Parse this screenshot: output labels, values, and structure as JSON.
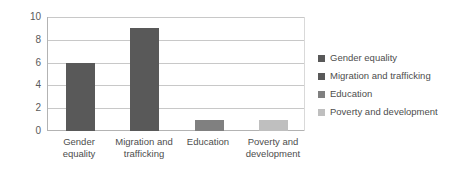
{
  "chart_data": {
    "type": "bar",
    "title": "",
    "subtitle": "",
    "xlabel": "",
    "ylabel": "",
    "categories": [
      "Gender equality",
      "Migration and trafficking",
      "Education",
      "Poverty and development"
    ],
    "values": [
      6,
      9,
      1,
      1
    ],
    "ylim": [
      0,
      10
    ],
    "yticks": [
      0,
      2,
      4,
      6,
      8,
      10
    ],
    "ytick_labels": [
      "0",
      "2",
      "4",
      "6",
      "8",
      "10"
    ],
    "grid": true,
    "grid_axis": "y",
    "legend_position": "right",
    "legend": [
      {
        "label": "Gender equality",
        "color": "#595959"
      },
      {
        "label": "Migration and trafficking",
        "color": "#595959"
      },
      {
        "label": "Education",
        "color": "#808080"
      },
      {
        "label": "Poverty and development",
        "color": "#bfbfbf"
      }
    ],
    "bar_colors": [
      "#595959",
      "#595959",
      "#808080",
      "#bfbfbf"
    ],
    "colors": {
      "background": "#ffffff",
      "gridline": "#c8c8c8",
      "axis": "#b3b3b3",
      "tick_text": "#5a5a5a",
      "label_text": "#4d4d4d"
    }
  }
}
